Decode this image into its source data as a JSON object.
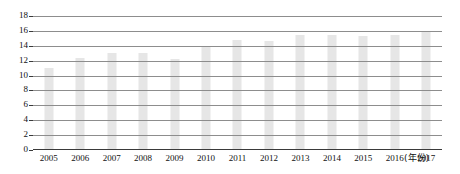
{
  "chart_data": {
    "type": "bar",
    "title": "",
    "subtitle": "",
    "xlabel": "(年份)",
    "ylabel": "",
    "categories": [
      "2005",
      "2006",
      "2007",
      "2008",
      "2009",
      "2010",
      "2011",
      "2012",
      "2013",
      "2014",
      "2015",
      "2016",
      "2017"
    ],
    "values": [
      11.0,
      12.3,
      13.0,
      13.0,
      12.2,
      14.0,
      14.8,
      14.6,
      15.5,
      15.5,
      15.3,
      15.4,
      16.0
    ],
    "series": [
      {
        "name": "",
        "values": [
          11.0,
          12.3,
          13.0,
          13.0,
          12.2,
          14.0,
          14.8,
          14.6,
          15.5,
          15.5,
          15.3,
          15.4,
          16.0
        ]
      }
    ],
    "ylim": [
      0,
      18
    ],
    "ytick_labels": [
      "0",
      "2",
      "4",
      "6",
      "8",
      "10",
      "12",
      "14",
      "16",
      "18"
    ],
    "ytick_values": [
      0,
      2,
      4,
      6,
      8,
      10,
      12,
      14,
      16,
      18
    ],
    "ystep": 2,
    "xlim_labels": [
      "2005",
      "2017"
    ],
    "grid": true,
    "grid_axis": "y",
    "legend": false,
    "legend_position": "none",
    "bar_color": "#e6e6e6",
    "gridline_color": "#8d8d8d",
    "axis_color": "#3a3a3a",
    "text_color": "#111111",
    "background_color": "#ffffff",
    "annotations": []
  }
}
